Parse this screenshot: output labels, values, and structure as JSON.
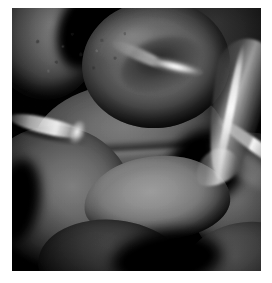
{
  "image": {
    "kind": "scanning-electron-micrograph",
    "subject": "Human red blood cells (erythrocytes)",
    "rendering": "grayscale",
    "caption": "",
    "alt_text": "Grayscale scanning electron micrograph showing a cluster of biconcave red blood cells with a thin membrane tether",
    "frame": {
      "canvas_width": 272,
      "canvas_height": 283,
      "plate_left": 12,
      "plate_top": 8,
      "plate_width": 249,
      "plate_height": 263,
      "page_background": "#ffffff",
      "plate_background": "#060606"
    },
    "palette": {
      "background_black": "#060606",
      "deep_shadow": "#0a0a0a",
      "cell_mid_gray": "#5e5e5e",
      "cell_light_gray": "#9b9b9b",
      "highlight_white": "#ffffff",
      "tether_gray": "#cdcdcd"
    }
  },
  "features": [
    {
      "id": "cell-top-left",
      "label": "Erythrocyte, upper left (partial)",
      "description": "Smooth domed cell cropped by the left and top edges"
    },
    {
      "id": "cell-top-right",
      "label": "Erythrocyte, upper right (background)",
      "description": "Dark out-of-focus cell behind the hero disc"
    },
    {
      "id": "cell-hero",
      "label": "Erythrocyte, biconcave disc",
      "description": "Classic doughnut-shaped red blood cell with central dimple and a bright crescent rim highlight"
    },
    {
      "id": "cell-middle",
      "label": "Erythrocyte, middle band",
      "description": "Broad cell spanning left to right beneath the hero disc"
    },
    {
      "id": "cell-left-lower",
      "label": "Erythrocyte, lower left",
      "description": "Large rounded cell occupying the lower-left quadrant"
    },
    {
      "id": "cell-pale",
      "label": "Erythrocyte, pale stippled cell",
      "description": "Front-facing lighter cell with a granular, pitted membrane surface"
    },
    {
      "id": "cell-right-mid",
      "label": "Erythrocyte, right with specular streak",
      "description": "Cell on the right edge carrying a long bright diagonal highlight"
    },
    {
      "id": "cell-bottom-right",
      "label": "Erythrocyte, bottom right (partial)",
      "description": "Cell cropped by the bottom-right corner of the plate"
    },
    {
      "id": "cell-bottom-centre",
      "label": "Erythrocyte, bottom centre (shadowed)",
      "description": "Dark cell in deep shadow along the lower border"
    },
    {
      "id": "tether-right",
      "label": "Membrane tether, right",
      "description": "Long thin bright filament of stretched membrane running vertically on the right"
    },
    {
      "id": "tether-left",
      "label": "Membrane filament, left",
      "description": "Short bright strand entering from the left edge at mid height"
    }
  ]
}
